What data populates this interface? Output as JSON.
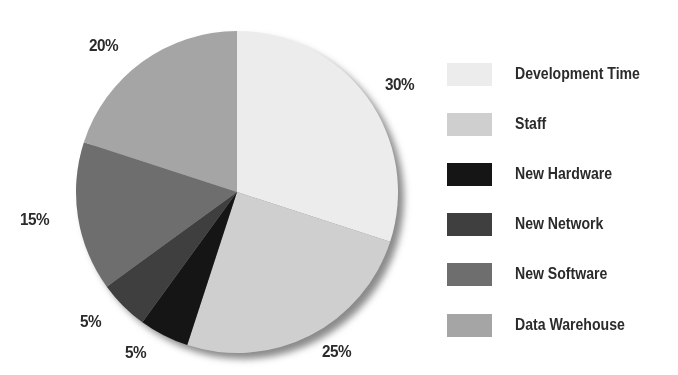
{
  "chart_data": {
    "type": "pie",
    "title": "",
    "start_angle": "12 o'clock",
    "direction": "clockwise",
    "categories": [
      "Development Time",
      "Staff",
      "New Hardware",
      "New Network",
      "New Software",
      "Data Warehouse"
    ],
    "values": [
      30,
      25,
      5,
      5,
      15,
      20
    ],
    "unit": "%",
    "colors": [
      "#ececec",
      "#cfcfcf",
      "#151515",
      "#3f3f3f",
      "#6e6e6e",
      "#a5a5a5"
    ],
    "data_labels": [
      "30%",
      "25%",
      "5%",
      "5%",
      "15%",
      "20%"
    ],
    "legend_position": "right",
    "grid": false
  },
  "labels": {
    "slice_0": "30%",
    "slice_1": "25%",
    "slice_2": "5%",
    "slice_3": "5%",
    "slice_4": "15%",
    "slice_5": "20%"
  },
  "legend": {
    "items": [
      {
        "label": "Development Time",
        "color": "#ececec"
      },
      {
        "label": "Staff",
        "color": "#cfcfcf"
      },
      {
        "label": "New Hardware",
        "color": "#151515"
      },
      {
        "label": "New Network",
        "color": "#3f3f3f"
      },
      {
        "label": "New Software",
        "color": "#6e6e6e"
      },
      {
        "label": "Data Warehouse",
        "color": "#a5a5a5"
      }
    ]
  }
}
